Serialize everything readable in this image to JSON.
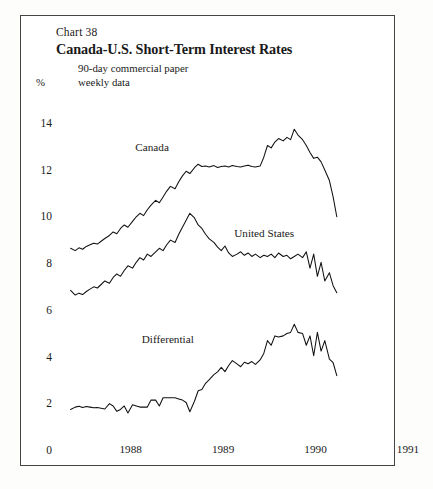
{
  "chart_number": "Chart 38",
  "title": "Canada-U.S. Short-Term Interest Rates",
  "subtitle_line1": "90-day commercial paper",
  "subtitle_line2": "weekly data",
  "unit_label": "%",
  "series_labels": {
    "canada": "Canada",
    "united_states": "United States",
    "differential": "Differential"
  },
  "axis": {
    "y_ticks": [
      "14",
      "12",
      "10",
      "8",
      "6",
      "4",
      "2",
      "0"
    ],
    "x_ticks": [
      "1988",
      "1989",
      "1990",
      "1991"
    ]
  },
  "chart_data": {
    "type": "line",
    "title": "Canada-U.S. Short-Term Interest Rates",
    "subtitle": "90-day commercial paper, weekly data",
    "xlabel": "",
    "ylabel": "%",
    "ylim": [
      0,
      14
    ],
    "xlim": [
      1987.8,
      1991.1
    ],
    "y_ticks": [
      0,
      2,
      4,
      6,
      8,
      10,
      12,
      14
    ],
    "x_ticks": [
      1988,
      1989,
      1990,
      1991
    ],
    "grid": false,
    "legend": "inline-annotations",
    "series": [
      {
        "name": "Canada",
        "label_x": 1988.55,
        "label_y": 12.95,
        "x": [
          1987.85,
          1987.9,
          1987.94,
          1987.98,
          1988.02,
          1988.06,
          1988.1,
          1988.14,
          1988.18,
          1988.22,
          1988.27,
          1988.31,
          1988.35,
          1988.39,
          1988.43,
          1988.47,
          1988.52,
          1988.56,
          1988.6,
          1988.64,
          1988.68,
          1988.72,
          1988.77,
          1988.81,
          1988.85,
          1988.89,
          1988.93,
          1988.98,
          1989.02,
          1989.06,
          1989.1,
          1989.14,
          1989.19,
          1989.23,
          1989.27,
          1989.31,
          1989.35,
          1989.4,
          1989.44,
          1989.48,
          1989.52,
          1989.56,
          1989.6,
          1989.65,
          1989.69,
          1989.73,
          1989.77,
          1989.81,
          1989.85,
          1989.9,
          1989.94,
          1989.98,
          1990.02,
          1990.06,
          1990.1,
          1990.15,
          1990.19,
          1990.23,
          1990.27,
          1990.31,
          1990.36,
          1990.4,
          1990.44,
          1990.48,
          1990.52,
          1990.56,
          1990.6,
          1990.65,
          1990.69,
          1990.73
        ],
        "y": [
          8.7,
          8.6,
          8.72,
          8.66,
          8.78,
          8.85,
          8.92,
          8.88,
          9.0,
          9.12,
          9.25,
          9.4,
          9.32,
          9.55,
          9.7,
          9.6,
          9.85,
          10.05,
          10.2,
          10.1,
          10.35,
          10.55,
          10.75,
          10.65,
          10.9,
          11.15,
          11.35,
          11.25,
          11.55,
          11.8,
          12.0,
          11.9,
          12.15,
          12.3,
          12.2,
          12.22,
          12.18,
          12.24,
          12.16,
          12.2,
          12.22,
          12.18,
          12.24,
          12.2,
          12.18,
          12.22,
          12.26,
          12.2,
          12.18,
          12.22,
          12.6,
          13.1,
          13.0,
          13.25,
          13.4,
          13.3,
          13.45,
          13.35,
          13.8,
          13.55,
          13.35,
          13.1,
          12.8,
          12.55,
          12.6,
          12.4,
          12.05,
          11.6,
          10.9,
          10.05
        ]
      },
      {
        "name": "United States",
        "label_x": 1989.62,
        "label_y": 9.25,
        "x": [
          1987.85,
          1987.9,
          1987.94,
          1987.98,
          1988.02,
          1988.06,
          1988.1,
          1988.14,
          1988.18,
          1988.22,
          1988.27,
          1988.31,
          1988.35,
          1988.39,
          1988.43,
          1988.47,
          1988.52,
          1988.56,
          1988.6,
          1988.64,
          1988.68,
          1988.72,
          1988.77,
          1988.81,
          1988.85,
          1988.89,
          1988.93,
          1988.98,
          1989.02,
          1989.06,
          1989.1,
          1989.14,
          1989.19,
          1989.23,
          1989.27,
          1989.31,
          1989.35,
          1989.4,
          1989.44,
          1989.48,
          1989.52,
          1989.56,
          1989.6,
          1989.65,
          1989.69,
          1989.73,
          1989.77,
          1989.81,
          1989.85,
          1989.9,
          1989.94,
          1989.98,
          1990.02,
          1990.06,
          1990.1,
          1990.15,
          1990.19,
          1990.23,
          1990.27,
          1990.31,
          1990.36,
          1990.4,
          1990.44,
          1990.48,
          1990.52,
          1990.56,
          1990.6,
          1990.65,
          1990.69,
          1990.73
        ],
        "y": [
          6.9,
          6.7,
          6.78,
          6.72,
          6.85,
          6.95,
          7.05,
          7.0,
          7.15,
          7.3,
          7.2,
          7.45,
          7.6,
          7.5,
          7.75,
          7.95,
          7.85,
          8.1,
          8.3,
          8.2,
          8.45,
          8.35,
          8.55,
          8.7,
          8.6,
          8.85,
          9.05,
          8.95,
          9.3,
          9.6,
          9.9,
          10.2,
          10.0,
          9.7,
          9.55,
          9.3,
          9.1,
          8.95,
          8.75,
          8.6,
          8.8,
          8.5,
          8.35,
          8.45,
          8.55,
          8.4,
          8.5,
          8.35,
          8.45,
          8.3,
          8.4,
          8.35,
          8.45,
          8.3,
          8.5,
          8.35,
          8.4,
          8.25,
          8.35,
          8.45,
          8.3,
          8.55,
          7.85,
          8.45,
          7.5,
          8.1,
          7.3,
          7.65,
          7.1,
          6.8
        ]
      },
      {
        "name": "Differential",
        "label_x": 1988.62,
        "label_y": 4.75,
        "x": [
          1987.85,
          1987.9,
          1987.94,
          1987.98,
          1988.02,
          1988.06,
          1988.1,
          1988.14,
          1988.18,
          1988.22,
          1988.27,
          1988.31,
          1988.35,
          1988.39,
          1988.43,
          1988.47,
          1988.52,
          1988.56,
          1988.6,
          1988.64,
          1988.68,
          1988.72,
          1988.77,
          1988.81,
          1988.85,
          1988.89,
          1988.93,
          1988.98,
          1989.02,
          1989.06,
          1989.1,
          1989.14,
          1989.19,
          1989.23,
          1989.27,
          1989.31,
          1989.35,
          1989.4,
          1989.44,
          1989.48,
          1989.52,
          1989.56,
          1989.6,
          1989.65,
          1989.69,
          1989.73,
          1989.77,
          1989.81,
          1989.85,
          1989.9,
          1989.94,
          1989.98,
          1990.02,
          1990.06,
          1990.1,
          1990.15,
          1990.19,
          1990.23,
          1990.27,
          1990.31,
          1990.36,
          1990.4,
          1990.44,
          1990.48,
          1990.52,
          1990.56,
          1990.6,
          1990.65,
          1990.69,
          1990.73
        ],
        "y": [
          1.8,
          1.9,
          1.94,
          1.88,
          1.93,
          1.9,
          1.87,
          1.88,
          1.85,
          1.82,
          2.05,
          1.95,
          1.72,
          1.8,
          1.95,
          1.65,
          2.0,
          1.95,
          1.9,
          1.9,
          1.9,
          2.2,
          2.2,
          1.95,
          2.3,
          2.3,
          2.3,
          2.3,
          2.25,
          2.2,
          2.1,
          1.7,
          2.15,
          2.6,
          2.65,
          2.92,
          3.08,
          3.29,
          3.41,
          3.6,
          3.42,
          3.68,
          3.89,
          3.75,
          3.63,
          3.82,
          3.76,
          3.85,
          3.73,
          3.92,
          4.2,
          4.75,
          4.55,
          4.95,
          4.9,
          4.95,
          5.05,
          5.1,
          5.45,
          5.1,
          5.05,
          4.55,
          4.95,
          4.1,
          5.1,
          4.3,
          4.75,
          3.95,
          3.8,
          3.25
        ]
      }
    ]
  }
}
